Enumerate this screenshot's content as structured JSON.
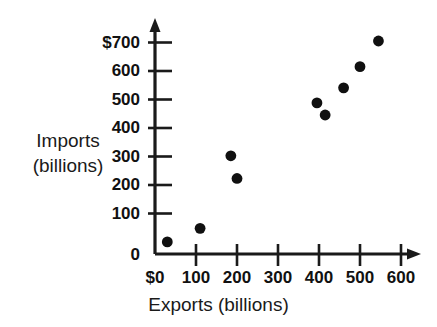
{
  "chart_data": {
    "type": "scatter",
    "title": "",
    "xlabel": "Exports (billions)",
    "ylabel_line1": "Imports",
    "ylabel_line2": "(billions)",
    "xlim": [
      0,
      650
    ],
    "ylim": [
      0,
      740
    ],
    "grid": false,
    "legend": null,
    "x_tick_labels": [
      "$0",
      "100",
      "200",
      "300",
      "400",
      "500",
      "600"
    ],
    "x_tick_values": [
      0,
      100,
      200,
      300,
      400,
      500,
      600
    ],
    "y_tick_labels": [
      "0",
      "100",
      "200",
      "300",
      "400",
      "500",
      "600",
      "$700"
    ],
    "y_tick_values": [
      0,
      100,
      200,
      300,
      400,
      500,
      600,
      700
    ],
    "marker_color": "#101010",
    "axis_color": "#1a1a1a",
    "points": [
      {
        "x": 30,
        "y": 40
      },
      {
        "x": 110,
        "y": 85
      },
      {
        "x": 185,
        "y": 325
      },
      {
        "x": 200,
        "y": 250
      },
      {
        "x": 395,
        "y": 500
      },
      {
        "x": 415,
        "y": 460
      },
      {
        "x": 460,
        "y": 550
      },
      {
        "x": 500,
        "y": 620
      },
      {
        "x": 545,
        "y": 705
      }
    ]
  }
}
